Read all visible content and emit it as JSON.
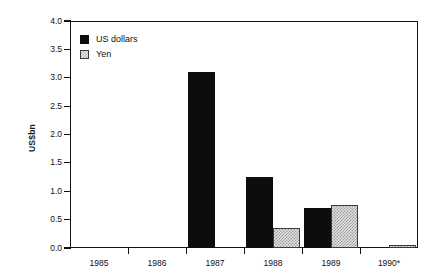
{
  "chart_data": {
    "type": "bar",
    "title": "",
    "xlabel": "",
    "ylabel": "US$bn",
    "categories": [
      "1985",
      "1986",
      "1987",
      "1988",
      "1989",
      "1990*"
    ],
    "series": [
      {
        "name": "US dollars",
        "color": "#0d0d0d",
        "values": [
          0,
          0,
          3.1,
          1.25,
          0.7,
          0
        ]
      },
      {
        "name": "Yen",
        "color": "#cccccc",
        "values": [
          0,
          0,
          0,
          0.35,
          0.75,
          0.05
        ]
      }
    ],
    "ylim": [
      0,
      4.0
    ],
    "yticks": [
      0.0,
      0.5,
      1.0,
      1.5,
      2.0,
      2.5,
      3.0,
      3.5,
      4.0
    ],
    "ytick_labels": [
      "0.0",
      "0.5",
      "1.0",
      "1.5",
      "2.0",
      "2.5",
      "3.0",
      "3.5",
      "4.0"
    ],
    "grid": false,
    "legend_position": "top-left",
    "legend": [
      "US dollars",
      "Yen"
    ],
    "footnote_marker": "*"
  }
}
